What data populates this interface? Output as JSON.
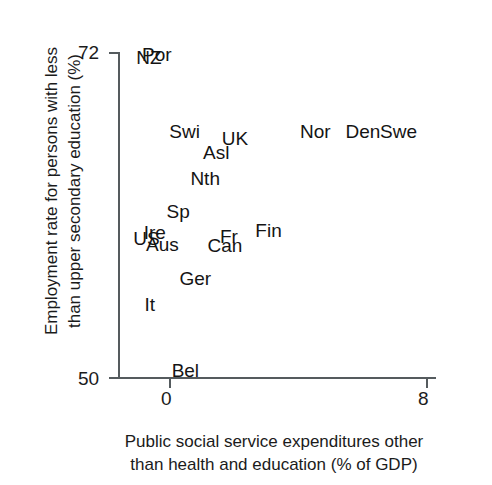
{
  "chart_data": {
    "type": "scatter",
    "title": "",
    "xlabel": "Public social service expenditures other than health and education (% of GDP)",
    "xlabel_line1": "Public social service expenditures other",
    "xlabel_line2": "than health and education (% of GDP)",
    "ylabel": "Employment rate for persons with less than upper secondary education (%)",
    "ylabel_line1": "Employment rate for persons with less",
    "ylabel_line2": "than upper secondary education (%)",
    "xlim": [
      0,
      8
    ],
    "ylim": [
      50,
      72
    ],
    "xticks": [
      "0",
      "8"
    ],
    "yticks": [
      "50",
      "72"
    ],
    "grid": false,
    "legend": "none",
    "marker": "text-label",
    "points": [
      {
        "label": "NZ",
        "x": 0.78,
        "y": 71.6
      },
      {
        "label": "Por",
        "x": 0.98,
        "y": 71.8
      },
      {
        "label": "Swi",
        "x": 1.68,
        "y": 66.6
      },
      {
        "label": "UK",
        "x": 2.95,
        "y": 66.1
      },
      {
        "label": "Nor",
        "x": 4.98,
        "y": 66.6
      },
      {
        "label": "Den",
        "x": 6.18,
        "y": 66.6
      },
      {
        "label": "Swe",
        "x": 7.08,
        "y": 66.6
      },
      {
        "label": "Asl",
        "x": 2.48,
        "y": 65.2
      },
      {
        "label": "Nth",
        "x": 2.2,
        "y": 63.4
      },
      {
        "label": "Sp",
        "x": 1.52,
        "y": 61.2
      },
      {
        "label": "US",
        "x": 0.72,
        "y": 59.4
      },
      {
        "label": "Ire",
        "x": 0.93,
        "y": 59.8
      },
      {
        "label": "Aus",
        "x": 1.12,
        "y": 59.0
      },
      {
        "label": "Fr",
        "x": 2.8,
        "y": 59.5
      },
      {
        "label": "Can",
        "x": 2.7,
        "y": 58.9
      },
      {
        "label": "Fin",
        "x": 3.8,
        "y": 59.9
      },
      {
        "label": "Ger",
        "x": 1.95,
        "y": 56.7
      },
      {
        "label": "It",
        "x": 0.8,
        "y": 54.9
      },
      {
        "label": "Bel",
        "x": 1.7,
        "y": 50.5
      }
    ]
  },
  "colors": {
    "axis": "#555b5e",
    "text": "#1b1b1b",
    "point_text": "#141414",
    "background": "#ffffff"
  }
}
